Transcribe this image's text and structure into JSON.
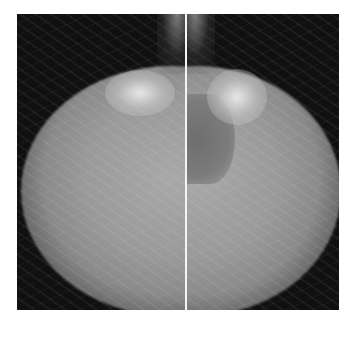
{
  "image": {
    "description": "Side-by-side pair of mammogram views separated by a white vertical line",
    "panels": [
      {
        "position": "left",
        "content": "mammogram view"
      },
      {
        "position": "right",
        "content": "mammogram view"
      }
    ],
    "colors": {
      "page_background": "#ffffff",
      "film_background": "#0e0e0e",
      "divider": "#f4f4f4",
      "tissue": "#9a9a9a"
    }
  }
}
